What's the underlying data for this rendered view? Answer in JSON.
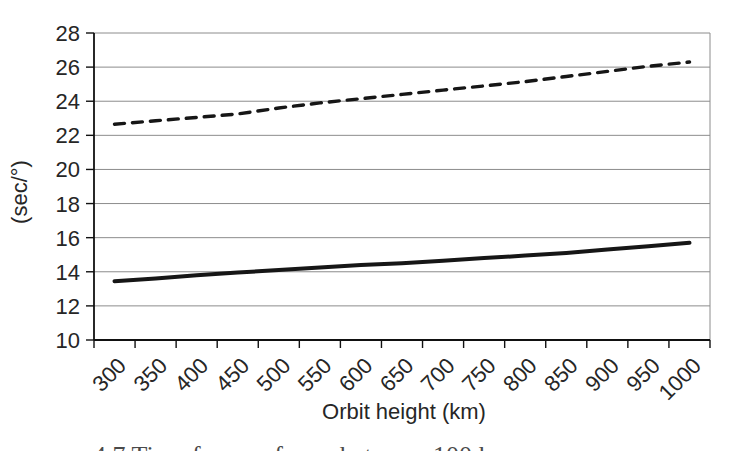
{
  "chart_data": {
    "type": "line",
    "title": "",
    "xlabel": "Orbit height (km)",
    "ylabel": "(sec/°)",
    "x": [
      300,
      350,
      400,
      450,
      500,
      550,
      600,
      650,
      700,
      750,
      800,
      850,
      900,
      950,
      1000
    ],
    "ylim": [
      10,
      28
    ],
    "ytick_step": 2,
    "yticks": [
      10,
      12,
      14,
      16,
      18,
      20,
      22,
      24,
      26,
      28
    ],
    "grid": "horizontal",
    "legend_position": "none",
    "series": [
      {
        "name": "upper-dashed-line",
        "style": "dashed",
        "color": "#161616",
        "values": [
          22.65,
          22.85,
          23.05,
          23.25,
          23.6,
          23.9,
          24.15,
          24.4,
          24.65,
          24.9,
          25.15,
          25.45,
          25.75,
          26.05,
          26.3
        ]
      },
      {
        "name": "lower-solid-line",
        "style": "solid",
        "color": "#161616",
        "values": [
          13.45,
          13.6,
          13.8,
          13.95,
          14.1,
          14.25,
          14.4,
          14.5,
          14.65,
          14.8,
          14.95,
          15.1,
          15.3,
          15.5,
          15.7
        ]
      }
    ]
  },
  "caption_fragment": "4.7    Time for … of a … between 100 k…",
  "colors": {
    "background": "#ffffff",
    "grid": "#8c8c8c",
    "axis": "#111111",
    "tick_text": "#262626"
  }
}
